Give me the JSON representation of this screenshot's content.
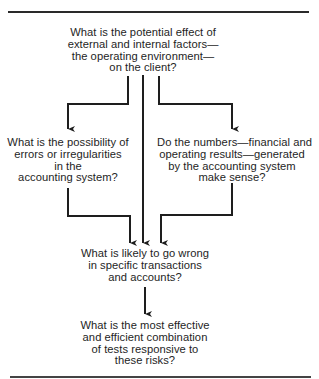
{
  "diagram": {
    "type": "flowchart",
    "colors": {
      "background": "#ffffff",
      "ink": "#1e1e1e"
    },
    "nodes": [
      {
        "id": "operating-environment",
        "lines": [
          "What is the potential effect of",
          "external and internal factors—",
          "the operating environment—",
          "on the client?"
        ]
      },
      {
        "id": "errors-irregularities",
        "lines": [
          "What is the possibility of",
          "errors or irregularities",
          "in the",
          "accounting system?"
        ]
      },
      {
        "id": "numbers-make-sense",
        "lines": [
          "Do the numbers—financial and",
          "operating results—generated",
          "by the accounting system",
          "make sense?"
        ]
      },
      {
        "id": "likely-wrong",
        "lines": [
          "What is likely to go wrong",
          "in specific transactions",
          "and accounts?"
        ]
      },
      {
        "id": "effective-tests",
        "lines": [
          "What is the most effective",
          "and efficient combination",
          "of tests responsive to",
          "these risks?"
        ]
      }
    ],
    "edges": [
      {
        "from": "operating-environment",
        "to": "errors-irregularities"
      },
      {
        "from": "operating-environment",
        "to": "likely-wrong"
      },
      {
        "from": "operating-environment",
        "to": "numbers-make-sense"
      },
      {
        "from": "errors-irregularities",
        "to": "likely-wrong"
      },
      {
        "from": "numbers-make-sense",
        "to": "likely-wrong"
      },
      {
        "from": "likely-wrong",
        "to": "effective-tests"
      }
    ]
  }
}
